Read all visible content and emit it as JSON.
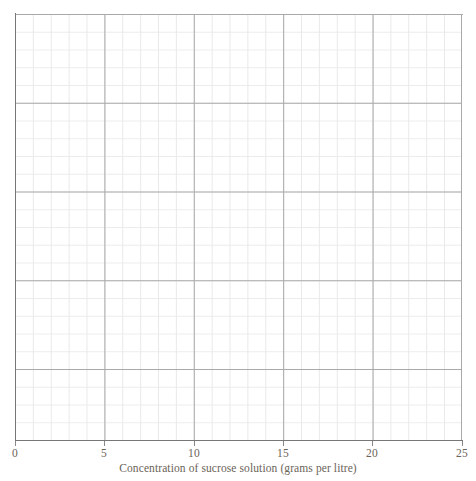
{
  "chart_data": {
    "type": "line",
    "title": "",
    "subtitle": "",
    "xlabel": "Concentration of sucrose solution (grams per litre)",
    "ylabel": "",
    "xlim": [
      0,
      25
    ],
    "ylim": [
      0,
      24
    ],
    "xticks": [
      {
        "value": 0,
        "label": "0"
      },
      {
        "value": 5,
        "label": "5"
      },
      {
        "value": 10,
        "label": "10"
      },
      {
        "value": 15,
        "label": "15"
      },
      {
        "value": 20,
        "label": "20"
      },
      {
        "value": 25,
        "label": "25"
      }
    ],
    "yticks": [],
    "ytick_labels": [],
    "series": [],
    "x": [],
    "values": [],
    "annotations": [],
    "legend": {
      "entries": [],
      "position": "none"
    },
    "grid": {
      "visible": true,
      "minor": true,
      "major": true,
      "minor_cells_x": 25,
      "minor_cells_y": 24,
      "major_every": 5,
      "minor_color": "#e9e9e9",
      "major_color": "#a9a9a9"
    },
    "axis_color": "#777777",
    "text_color": "#6b6358",
    "background": "#ffffff",
    "note": "Blank graph paper grid; no data series plotted."
  },
  "axis": {
    "x_title": "Concentration of sucrose solution (grams per litre)",
    "ticks": [
      {
        "label": "0",
        "left_px": 15
      },
      {
        "label": "5",
        "left_px": 104
      },
      {
        "label": "10",
        "left_px": 194
      },
      {
        "label": "15",
        "left_px": 283
      },
      {
        "label": "20",
        "left_px": 372
      },
      {
        "label": "25",
        "left_px": 462
      }
    ]
  }
}
